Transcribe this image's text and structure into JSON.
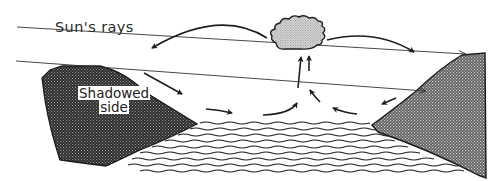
{
  "diagram": {
    "labels": {
      "sun_rays": "Sun's rays",
      "shadowed_line1": "Shadowed",
      "shadowed_line2": "side"
    },
    "elements": {
      "left_hill": "shadowed-hill",
      "right_hill": "sunlit-hill",
      "cloud": "cumulus-cloud",
      "water": "water-surface",
      "rays": [
        "sun-ray-upper",
        "sun-ray-lower"
      ],
      "airflow_arrows": 10
    },
    "colors": {
      "ink": "#1e1e1e",
      "dark_fill": "#3a3a3a",
      "right_fill": "#7a7a7a",
      "cloud_fill": "#b8b8b8",
      "background": "#ffffff"
    }
  }
}
